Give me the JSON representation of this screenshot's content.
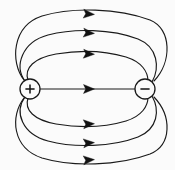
{
  "figure": {
    "width": 175,
    "height": 170,
    "background_color": "#fbfbfb",
    "line_color": "#1a1a1a",
    "arrow_color": "#111111"
  },
  "charges": [
    {
      "id": "positive",
      "label": "+",
      "polarity": "positive",
      "cx": 30,
      "cy": 89,
      "r": 10
    },
    {
      "id": "negative",
      "label": "−",
      "polarity": "negative",
      "cx": 145,
      "cy": 89,
      "r": 10
    }
  ],
  "field_lines": [
    {
      "id": "arc-up-3",
      "position": "upper-outer",
      "path": "M 24 80 C 10 62, 12 26, 42 16 C 72 7, 118 8, 150 20 C 172 29, 172 62, 154 81",
      "arrow": {
        "x": 89,
        "y": 14,
        "angle": 4
      }
    },
    {
      "id": "arc-up-2",
      "position": "upper-middle",
      "path": "M 25 81 C 14 66, 22 42, 48 35 C 74 28, 112 29, 138 39 C 158 47, 160 68, 152 82",
      "arrow": {
        "x": 89,
        "y": 33,
        "angle": 4
      }
    },
    {
      "id": "arc-up-1",
      "position": "upper-inner",
      "path": "M 28 80 C 24 68, 34 58, 56 54 C 80 50, 106 51, 126 57 C 142 62, 148 72, 148 81",
      "arrow": {
        "x": 89,
        "y": 54,
        "angle": 3
      }
    },
    {
      "id": "axis-line",
      "position": "center",
      "path": "M 40 89 L 135 89",
      "arrow": {
        "x": 89,
        "y": 89,
        "angle": 0
      }
    },
    {
      "id": "arc-dn-1",
      "position": "lower-inner",
      "path": "M 28 98 C 24 110, 34 120, 56 124 C 80 128, 106 127, 126 121 C 142 116, 148 106, 148 97",
      "arrow": {
        "x": 89,
        "y": 124,
        "angle": -3
      }
    },
    {
      "id": "arc-dn-2",
      "position": "lower-middle",
      "path": "M 25 97 C 14 112, 22 134, 48 141 C 74 148, 112 147, 138 137 C 158 129, 160 110, 152 96",
      "arrow": {
        "x": 89,
        "y": 143,
        "angle": -4
      }
    },
    {
      "id": "arc-dn-3",
      "position": "lower-outer",
      "path": "M 24 98 C 10 116, 12 148, 42 158 C 72 167, 118 166, 150 154 C 172 145, 172 116, 154 97",
      "arrow": {
        "x": 89,
        "y": 160,
        "angle": -4
      }
    }
  ],
  "arrow_count": 7,
  "arrow_direction": "right",
  "arrow_size": {
    "length": 11,
    "half_width": 4.5
  }
}
